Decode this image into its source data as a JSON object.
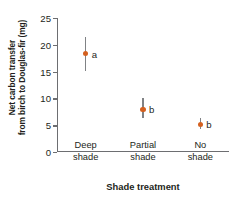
{
  "chart_data": {
    "type": "scatter",
    "title": "",
    "xlabel": "Shade treatment",
    "ylabel_line1": "Net carbon transfer",
    "ylabel_line2": "from birch to Douglas-fir (mg)",
    "categories": [
      "Deep shade",
      "Partial shade",
      "No shade"
    ],
    "category_lines": [
      [
        "Deep",
        "shade"
      ],
      [
        "Partial",
        "shade"
      ],
      [
        "No",
        "shade"
      ]
    ],
    "values": [
      18.3,
      8.0,
      5.2
    ],
    "error_low": [
      15.2,
      6.3,
      4.2
    ],
    "error_high": [
      21.5,
      10.0,
      6.3
    ],
    "annotations": [
      "a",
      "b",
      "b"
    ],
    "ylim": [
      0,
      25
    ],
    "yticks": [
      0,
      5,
      10,
      15,
      20,
      25
    ],
    "ytick_labels": [
      "0",
      "5",
      "10",
      "15",
      "20",
      "25"
    ],
    "grid": false,
    "legend": false,
    "marker_color": "#d4601f",
    "errorbar_color": "#808285",
    "axis_color": "#6d6e71",
    "text_color": "#231f20"
  }
}
